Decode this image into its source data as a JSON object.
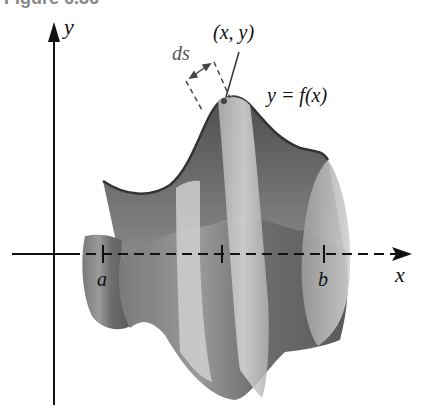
{
  "figure": {
    "caption": "Figure 6.36",
    "labels": {
      "y_axis": "y",
      "x_axis": "x",
      "point": "(x, y)",
      "arc_length": "ds",
      "curve": "y = f(x)",
      "lower_bound": "a",
      "upper_bound": "b"
    },
    "colors": {
      "surface_dark": "#5a5a5a",
      "surface_mid": "#8a8a8a",
      "band_light": "#c8c8c8",
      "axis": "#111111",
      "background": "#ffffff"
    }
  }
}
